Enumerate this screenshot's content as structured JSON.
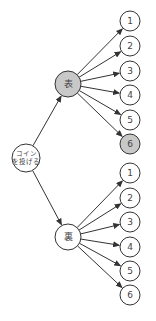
{
  "diagram": {
    "type": "tree",
    "title": "",
    "colors": {
      "highlight": "#c8c8c8",
      "normal": "#ffffff",
      "stroke": "#333333"
    },
    "root": {
      "id": "root",
      "label_line1": "コイン",
      "label_line2": "を投げる",
      "x": 26,
      "y": 158,
      "r": 14,
      "highlight": false
    },
    "branches": [
      {
        "id": "heads",
        "label": "表",
        "x": 68,
        "y": 84,
        "r": 13,
        "highlight": true,
        "leaves": [
          {
            "label": "1",
            "y": 21,
            "highlight": false
          },
          {
            "label": "2",
            "y": 46,
            "highlight": false
          },
          {
            "label": "3",
            "y": 71,
            "highlight": false
          },
          {
            "label": "4",
            "y": 95,
            "highlight": false
          },
          {
            "label": "5",
            "y": 120,
            "highlight": false
          },
          {
            "label": "6",
            "y": 144,
            "highlight": true
          }
        ]
      },
      {
        "id": "tails",
        "label": "裏",
        "x": 68,
        "y": 237,
        "r": 13,
        "highlight": false,
        "leaves": [
          {
            "label": "1",
            "y": 173,
            "highlight": false
          },
          {
            "label": "2",
            "y": 198,
            "highlight": false
          },
          {
            "label": "3",
            "y": 222,
            "highlight": false
          },
          {
            "label": "4",
            "y": 247,
            "highlight": false
          },
          {
            "label": "5",
            "y": 271,
            "highlight": false
          },
          {
            "label": "6",
            "y": 295,
            "highlight": false
          }
        ]
      }
    ],
    "leaf_x": 130,
    "leaf_r": 10
  }
}
